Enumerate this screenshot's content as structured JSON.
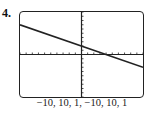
{
  "problem": {
    "number": "4."
  },
  "window": {
    "caption": "−10, 10, 1, −10, 10, 1"
  },
  "chart_data": {
    "type": "line",
    "title": "",
    "xlabel": "",
    "ylabel": "",
    "window": {
      "xmin": -10,
      "xmax": 10,
      "xscl": 1,
      "ymin": -10,
      "ymax": 10,
      "yscl": 1
    },
    "xlim": [
      -10,
      10
    ],
    "ylim": [
      -10,
      10
    ],
    "grid": false,
    "legend": null,
    "series": [
      {
        "name": "y = -0.5x + 2",
        "x": [
          -10,
          10
        ],
        "y": [
          7,
          -3
        ]
      }
    ],
    "annotations": [
      "y-intercept ≈ 2",
      "x-intercept ≈ 4"
    ],
    "colors": {
      "line": "#222222",
      "axes": "#222222",
      "frame": "#222222"
    }
  }
}
